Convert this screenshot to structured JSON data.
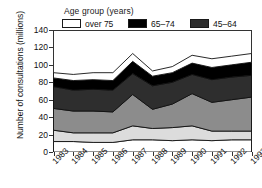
{
  "chart_data": {
    "type": "area",
    "stacked": true,
    "title": "",
    "xlabel": "",
    "ylabel": "Number of consultations (millions)",
    "legend_title": "Age group (years)",
    "legend_position": "top",
    "grid": false,
    "categories": [
      "1983",
      "1984",
      "1985",
      "1986",
      "1987",
      "1988",
      "1989",
      "1990",
      "1991",
      "1992",
      "1993"
    ],
    "x": [
      1983,
      1984,
      1985,
      1986,
      1987,
      1988,
      1989,
      1990,
      1991,
      1992,
      1993
    ],
    "ylim": [
      0,
      140
    ],
    "yticks": [
      0,
      20,
      40,
      60,
      80,
      100,
      120,
      140
    ],
    "series": [
      {
        "name": "0-4",
        "color": "#ffffff",
        "values": [
          12,
          12,
          11,
          11,
          14,
          14,
          13,
          14,
          13,
          14,
          14
        ]
      },
      {
        "name": "5-15",
        "color": "#dcdcdc",
        "values": [
          13,
          10,
          11,
          11,
          16,
          13,
          15,
          16,
          11,
          10,
          10
        ]
      },
      {
        "name": "16-44",
        "color": "#8c8c8c",
        "values": [
          25,
          25,
          25,
          24,
          36,
          22,
          27,
          37,
          33,
          36,
          39
        ]
      },
      {
        "name": "45-64",
        "color": "#2e2e2e",
        "values": [
          25,
          24,
          25,
          25,
          24,
          27,
          25,
          22,
          26,
          26,
          25
        ]
      },
      {
        "name": "65-74",
        "color": "#000000",
        "values": [
          10,
          11,
          11,
          11,
          14,
          11,
          11,
          13,
          14,
          14,
          15
        ]
      },
      {
        "name": "over 75",
        "color": "#ffffff",
        "values": [
          6,
          7,
          8,
          9,
          9,
          6,
          7,
          9,
          10,
          10,
          10
        ]
      }
    ],
    "cumulative_tops": {
      "0-4": [
        12,
        12,
        11,
        11,
        14,
        14,
        13,
        14,
        13,
        14,
        14
      ],
      "5-15": [
        25,
        22,
        22,
        22,
        30,
        27,
        28,
        30,
        24,
        24,
        24
      ],
      "16-44": [
        50,
        47,
        47,
        46,
        66,
        49,
        55,
        67,
        57,
        60,
        63
      ],
      "45-64": [
        75,
        71,
        72,
        71,
        90,
        76,
        80,
        89,
        83,
        86,
        88
      ],
      "65-74": [
        85,
        82,
        83,
        82,
        104,
        87,
        91,
        102,
        97,
        100,
        103
      ],
      "over 75": [
        91,
        89,
        91,
        91,
        113,
        93,
        98,
        111,
        107,
        110,
        113
      ]
    }
  },
  "legend": {
    "title": "Age group (years)",
    "items": [
      {
        "label": "over 75",
        "color": "#ffffff"
      },
      {
        "label": "65–74",
        "color": "#000000"
      },
      {
        "label": "45–64",
        "color": "#2e2e2e"
      },
      {
        "label": "16–44",
        "color": "#8c8c8c"
      },
      {
        "label": "5–15",
        "color": "#dcdcdc"
      },
      {
        "label": "0–4",
        "color": "#ffffff"
      }
    ]
  },
  "axes": {
    "y_title": "Number of consultations (millions)",
    "y_ticks": [
      "0",
      "20",
      "40",
      "60",
      "80",
      "100",
      "120",
      "140"
    ],
    "x_ticks": [
      "1983",
      "1984",
      "1985",
      "1986",
      "1987",
      "1988",
      "1989",
      "1990",
      "1991",
      "1992",
      "1993"
    ]
  }
}
